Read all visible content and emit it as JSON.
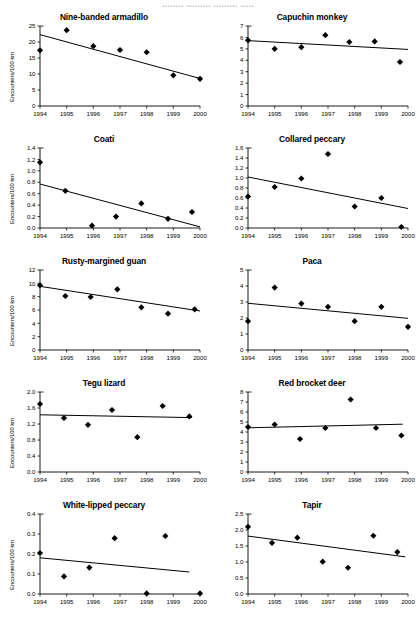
{
  "figure": {
    "cut_off_header": "........ ......... ......... .....",
    "y_axis_label": "Encounters/100 km",
    "x_ticks": [
      "1994",
      "1995",
      "1996",
      "1997",
      "1998",
      "1999",
      "2000"
    ],
    "x_range": [
      1994,
      2000
    ]
  },
  "chart_data": [
    {
      "type": "scatter",
      "title": "Nine-banded armadillo",
      "xlabel": "",
      "ylabel": "Encounters/100 km",
      "show_ylabel": true,
      "xlim": [
        1994,
        2000
      ],
      "ylim": [
        0,
        25
      ],
      "yticks": [
        0,
        5,
        10,
        15,
        20,
        25
      ],
      "ytick_labels": [
        "0",
        "5",
        "10",
        "15",
        "20",
        "25"
      ],
      "x": [
        1994.0,
        1995.0,
        1996.0,
        1997.0,
        1998.0,
        1999.0,
        2000.0
      ],
      "values": [
        17.4,
        23.7,
        18.7,
        17.5,
        16.8,
        9.6,
        8.5
      ],
      "trend": {
        "x0": 1994.0,
        "y0": 22.3,
        "x1": 2000.0,
        "y1": 8.6
      },
      "grid": false,
      "legend": "none"
    },
    {
      "type": "scatter",
      "title": "Capuchin monkey",
      "xlabel": "",
      "ylabel": "",
      "show_ylabel": false,
      "xlim": [
        1994,
        2000
      ],
      "ylim": [
        0,
        7
      ],
      "yticks": [
        0,
        1,
        2,
        3,
        4,
        5,
        6,
        7
      ],
      "ytick_labels": [
        "0",
        "1",
        "2",
        "3",
        "4",
        "5",
        "6",
        "7"
      ],
      "x": [
        1994.0,
        1995.0,
        1996.0,
        1996.9,
        1997.8,
        1998.75,
        1999.7
      ],
      "values": [
        5.75,
        5.0,
        5.15,
        6.2,
        5.6,
        5.65,
        3.85
      ],
      "trend": {
        "x0": 1994.0,
        "y0": 5.72,
        "x1": 2000.0,
        "y1": 4.95
      },
      "grid": false,
      "legend": "none"
    },
    {
      "type": "scatter",
      "title": "Coati",
      "xlabel": "",
      "ylabel": "Encounters/100 km",
      "show_ylabel": true,
      "xlim": [
        1994,
        2000
      ],
      "ylim": [
        0.0,
        1.4
      ],
      "yticks": [
        0.0,
        0.2,
        0.4,
        0.6,
        0.8,
        1.0,
        1.2,
        1.4
      ],
      "ytick_labels": [
        "0.0",
        "0.2",
        "0.4",
        "0.6",
        "0.8",
        "1.0",
        "1.2",
        "1.4"
      ],
      "x": [
        1994.0,
        1994.95,
        1995.95,
        1996.85,
        1997.8,
        1998.8,
        1999.7
      ],
      "values": [
        1.15,
        0.65,
        0.04,
        0.2,
        0.43,
        0.16,
        0.28
      ],
      "trend": {
        "x0": 1994.0,
        "y0": 0.77,
        "x1": 2000.0,
        "y1": 0.02
      },
      "grid": false,
      "legend": "none"
    },
    {
      "type": "scatter",
      "title": "Collared peccary",
      "xlabel": "",
      "ylabel": "",
      "show_ylabel": false,
      "xlim": [
        1994,
        2000
      ],
      "ylim": [
        0.0,
        1.6
      ],
      "yticks": [
        0.0,
        0.2,
        0.4,
        0.6,
        0.8,
        1.0,
        1.2,
        1.4,
        1.6
      ],
      "ytick_labels": [
        "0.0",
        "0.2",
        "0.4",
        "0.6",
        "0.8",
        "1.0",
        "1.2",
        "1.4",
        "1.6"
      ],
      "x": [
        1994.0,
        1995.0,
        1996.0,
        1997.0,
        1998.0,
        1999.0,
        1999.75
      ],
      "values": [
        0.63,
        0.82,
        0.99,
        1.48,
        0.43,
        0.6,
        0.02
      ],
      "trend": {
        "x0": 1994.0,
        "y0": 1.02,
        "x1": 2000.0,
        "y1": 0.39
      },
      "grid": false,
      "legend": "none"
    },
    {
      "type": "scatter",
      "title": "Rusty-margined guan",
      "xlabel": "",
      "ylabel": "Encounters/100 km",
      "show_ylabel": true,
      "xlim": [
        1994,
        2000
      ],
      "ylim": [
        0,
        12
      ],
      "yticks": [
        0,
        2,
        4,
        6,
        8,
        10,
        12
      ],
      "ytick_labels": [
        "0",
        "2",
        "4",
        "6",
        "8",
        "10",
        "12"
      ],
      "x": [
        1994.0,
        1994.95,
        1995.9,
        1996.9,
        1997.8,
        1998.8,
        1999.8
      ],
      "values": [
        9.7,
        8.1,
        7.95,
        9.1,
        6.4,
        5.45,
        6.1
      ],
      "trend": {
        "x0": 1994.0,
        "y0": 9.55,
        "x1": 2000.0,
        "y1": 5.85
      },
      "grid": false,
      "legend": "none"
    },
    {
      "type": "scatter",
      "title": "Paca",
      "xlabel": "",
      "ylabel": "",
      "show_ylabel": false,
      "xlim": [
        1994,
        2000
      ],
      "ylim": [
        0,
        5
      ],
      "yticks": [
        0,
        1,
        2,
        3,
        4,
        5
      ],
      "ytick_labels": [
        "0",
        "1",
        "2",
        "3",
        "4",
        "5"
      ],
      "x": [
        1994.0,
        1995.0,
        1996.0,
        1997.0,
        1998.0,
        1999.0,
        2000.0
      ],
      "values": [
        1.8,
        3.9,
        2.9,
        2.7,
        1.8,
        2.7,
        1.45
      ],
      "trend": {
        "x0": 1994.0,
        "y0": 2.92,
        "x1": 2000.0,
        "y1": 1.98
      },
      "grid": false,
      "legend": "none"
    },
    {
      "type": "scatter",
      "title": "Tegu lizard",
      "xlabel": "",
      "ylabel": "Encounters/100 km",
      "show_ylabel": true,
      "xlim": [
        1994,
        2000
      ],
      "ylim": [
        0.0,
        2.0
      ],
      "yticks": [
        0.0,
        0.4,
        0.8,
        1.2,
        1.6,
        2.0
      ],
      "ytick_labels": [
        "0.0",
        "0.4",
        "0.8",
        "1.2",
        "1.6",
        "2.0"
      ],
      "x": [
        1994.0,
        1994.9,
        1995.8,
        1996.7,
        1997.65,
        1998.6,
        1999.6
      ],
      "values": [
        1.7,
        1.35,
        1.18,
        1.55,
        0.87,
        1.65,
        1.39
      ],
      "trend": {
        "x0": 1994.0,
        "y0": 1.43,
        "x1": 1999.7,
        "y1": 1.36
      },
      "grid": false,
      "legend": "none"
    },
    {
      "type": "scatter",
      "title": "Red brocket deer",
      "xlabel": "",
      "ylabel": "",
      "show_ylabel": false,
      "xlim": [
        1994,
        2000
      ],
      "ylim": [
        0,
        8
      ],
      "yticks": [
        0,
        1,
        2,
        3,
        4,
        5,
        6,
        7,
        8
      ],
      "ytick_labels": [
        "0",
        "1",
        "2",
        "3",
        "4",
        "5",
        "6",
        "7",
        "8"
      ],
      "x": [
        1994.0,
        1995.0,
        1995.95,
        1996.9,
        1997.85,
        1998.8,
        1999.75
      ],
      "values": [
        4.5,
        4.75,
        3.3,
        4.4,
        7.25,
        4.4,
        3.65
      ],
      "trend": {
        "x0": 1994.0,
        "y0": 4.42,
        "x1": 1999.8,
        "y1": 4.78
      },
      "grid": false,
      "legend": "none"
    },
    {
      "type": "scatter",
      "title": "White-lipped peccary",
      "xlabel": "",
      "ylabel": "Encounters/100 km",
      "show_ylabel": true,
      "xlim": [
        1994,
        2000
      ],
      "ylim": [
        0.0,
        0.4
      ],
      "yticks": [
        0.0,
        0.1,
        0.2,
        0.3,
        0.4
      ],
      "ytick_labels": [
        "0.0",
        "0.1",
        "0.2",
        "0.3",
        "0.4"
      ],
      "x": [
        1994.0,
        1994.9,
        1995.85,
        1996.8,
        1998.0,
        1998.7,
        2000.0
      ],
      "values": [
        0.205,
        0.088,
        0.132,
        0.279,
        0.003,
        0.29,
        0.003
      ],
      "trend": {
        "x0": 1994.0,
        "y0": 0.181,
        "x1": 1999.6,
        "y1": 0.11
      },
      "grid": false,
      "legend": "none"
    },
    {
      "type": "scatter",
      "title": "Tapir",
      "xlabel": "",
      "ylabel": "",
      "show_ylabel": false,
      "xlim": [
        1994,
        2000
      ],
      "ylim": [
        0.0,
        2.5
      ],
      "yticks": [
        0.0,
        0.5,
        1.0,
        1.5,
        2.0,
        2.5
      ],
      "ytick_labels": [
        "0.0",
        "0.5",
        "1.0",
        "1.5",
        "2.0",
        "2.5"
      ],
      "x": [
        1994.0,
        1994.9,
        1995.85,
        1996.8,
        1997.75,
        1998.7,
        1999.6
      ],
      "values": [
        2.1,
        1.6,
        1.76,
        1.01,
        0.82,
        1.82,
        1.31
      ],
      "trend": {
        "x0": 1994.0,
        "y0": 1.81,
        "x1": 1999.9,
        "y1": 1.16
      },
      "grid": false,
      "legend": "none"
    }
  ]
}
